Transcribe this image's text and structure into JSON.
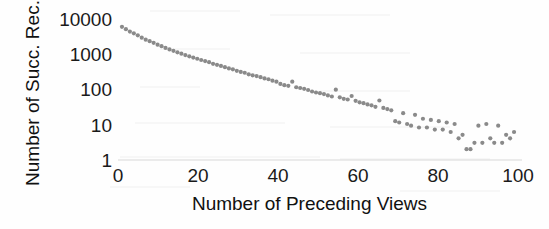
{
  "chart_data": {
    "type": "scatter",
    "title": "",
    "xlabel": "Number of Preceding Views",
    "ylabel": "Number of Succ. Rec.",
    "xlim": [
      0,
      101
    ],
    "ylim": [
      1,
      10000
    ],
    "yscale": "log",
    "xscale": "linear",
    "grid": false,
    "legend": null,
    "xticks": [
      0,
      20,
      40,
      60,
      80,
      100
    ],
    "xtick_labels": [
      "0",
      "20",
      "40",
      "60",
      "80",
      "100"
    ],
    "yticks": [
      1,
      10,
      100,
      1000,
      10000
    ],
    "ytick_labels": [
      "1",
      "10",
      "100",
      "1000",
      "10000"
    ],
    "marker": "circle",
    "marker_color": "#8a8a8a",
    "marker_size": 2.1,
    "x": [
      1,
      2,
      3,
      4,
      5,
      6,
      7,
      8,
      9,
      10,
      11,
      12,
      13,
      14,
      15,
      16,
      17,
      18,
      19,
      20,
      21,
      22,
      23,
      24,
      25,
      26,
      27,
      28,
      29,
      30,
      31,
      32,
      33,
      34,
      35,
      36,
      37,
      38,
      39,
      40,
      41,
      42,
      43,
      44,
      45,
      46,
      47,
      48,
      49,
      50,
      51,
      52,
      53,
      54,
      55,
      56,
      57,
      58,
      59,
      60,
      61,
      62,
      63,
      64,
      65,
      66,
      67,
      68,
      69,
      70,
      71,
      72,
      73,
      74,
      75,
      76,
      77,
      78,
      79,
      80,
      81,
      82,
      83,
      84,
      85,
      86,
      87,
      88,
      89,
      90,
      91,
      92,
      93,
      94,
      95,
      96,
      97,
      98,
      99,
      100
    ],
    "values": [
      5000,
      4300,
      3700,
      3300,
      2900,
      2500,
      2200,
      2000,
      1800,
      1600,
      1450,
      1300,
      1180,
      1080,
      980,
      900,
      820,
      760,
      700,
      650,
      600,
      560,
      520,
      470,
      440,
      410,
      380,
      350,
      330,
      300,
      280,
      265,
      240,
      225,
      215,
      200,
      185,
      175,
      160,
      150,
      130,
      120,
      115,
      150,
      105,
      100,
      95,
      88,
      80,
      75,
      72,
      68,
      62,
      58,
      90,
      55,
      50,
      48,
      60,
      44,
      40,
      38,
      35,
      33,
      30,
      45,
      28,
      26,
      24,
      12,
      11,
      20,
      10,
      9,
      18,
      8,
      14,
      8,
      13,
      7,
      12,
      7,
      11,
      6,
      10,
      4,
      5,
      2,
      2,
      3,
      9,
      3,
      10,
      4,
      3,
      9,
      3,
      5,
      4,
      6
    ]
  }
}
